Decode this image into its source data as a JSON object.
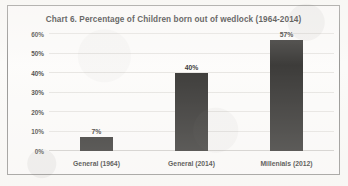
{
  "chart_data": {
    "type": "bar",
    "title": "Chart 6. Percentage of Children born out of wedlock (1964-2014)",
    "categories": [
      "General (1964)",
      "General (2014)",
      "Millenials (2012)"
    ],
    "values": [
      7,
      40,
      57
    ],
    "value_labels": [
      "7%",
      "40%",
      "57%"
    ],
    "xlabel": "",
    "ylabel": "",
    "ylim": [
      0,
      60
    ],
    "ytick_values": [
      60,
      50,
      40,
      30,
      20,
      10,
      0
    ],
    "ytick_labels": [
      "60%",
      "50%",
      "40%",
      "30%",
      "20%",
      "10%",
      "0%"
    ],
    "grid": true,
    "legend": false,
    "series": [
      {
        "name": "Percentage of children born out of wedlock",
        "values": [
          7,
          40,
          57
        ],
        "color": "#262523"
      }
    ]
  },
  "style": {
    "bar_color": "#262523",
    "page_background": "#fbfaf8",
    "plot_background": "#fdfcfb",
    "gridline_color": "#e6e4e1",
    "frame_border_color": "#8d8c8a",
    "text_color": "#25241f"
  }
}
